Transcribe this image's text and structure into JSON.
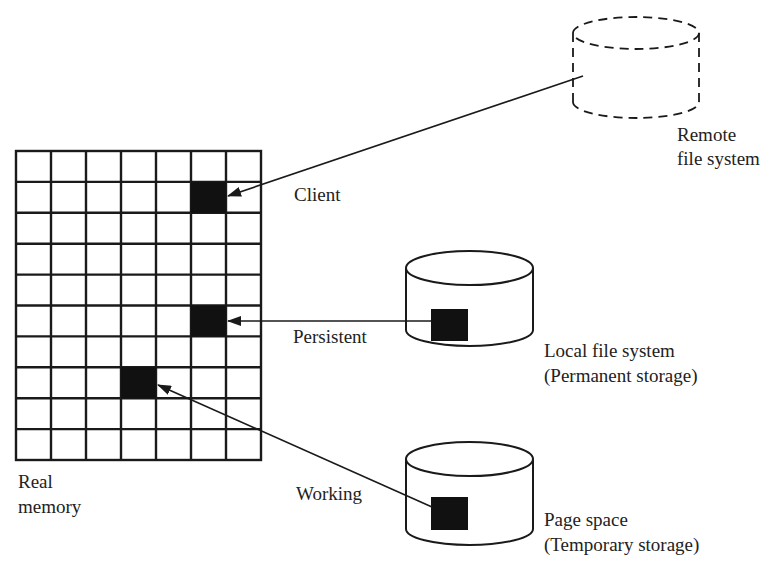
{
  "diagram": {
    "colors": {
      "stroke": "#1a1a1a",
      "fill": "#111111",
      "background": "#ffffff",
      "text": "#222222"
    },
    "real_memory": {
      "label_line1": "Real",
      "label_line2": "memory",
      "columns": 7,
      "rows": 10,
      "filled_cells": [
        {
          "col": 5,
          "row": 1,
          "segment": "Client"
        },
        {
          "col": 5,
          "row": 5,
          "segment": "Persistent"
        },
        {
          "col": 3,
          "row": 7,
          "segment": "Working"
        }
      ]
    },
    "segments": [
      {
        "id": "client",
        "label": "Client"
      },
      {
        "id": "persistent",
        "label": "Persistent"
      },
      {
        "id": "working",
        "label": "Working"
      }
    ],
    "storage": [
      {
        "id": "remote",
        "label_line1": "Remote",
        "label_line2": "file system",
        "style": "dashed"
      },
      {
        "id": "local",
        "label_line1": "Local file system",
        "label_line2": "(Permanent storage)",
        "style": "solid"
      },
      {
        "id": "page",
        "label_line1": "Page space",
        "label_line2": "(Temporary storage)",
        "style": "solid"
      }
    ]
  }
}
